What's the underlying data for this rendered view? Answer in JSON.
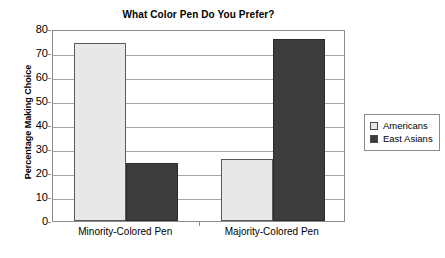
{
  "chart_data": {
    "type": "bar",
    "title": "What Color Pen Do You Prefer?",
    "xlabel": "",
    "ylabel": "Percentage Making Choice",
    "categories": [
      "Minority-Colored Pen",
      "Majority-Colored Pen"
    ],
    "series": [
      {
        "name": "Americans",
        "values": [
          74,
          26
        ],
        "color": "#e8e8e8"
      },
      {
        "name": "East Asians",
        "values": [
          24,
          76
        ],
        "color": "#3d3d3d"
      }
    ],
    "ylim": [
      0,
      80
    ],
    "yticks": [
      0,
      10,
      20,
      30,
      40,
      50,
      60,
      70,
      80
    ],
    "ytick_labels": [
      "0",
      "10",
      "20",
      "30",
      "40",
      "50",
      "60",
      "70",
      "80"
    ],
    "grid": true,
    "legend_position": "right"
  }
}
